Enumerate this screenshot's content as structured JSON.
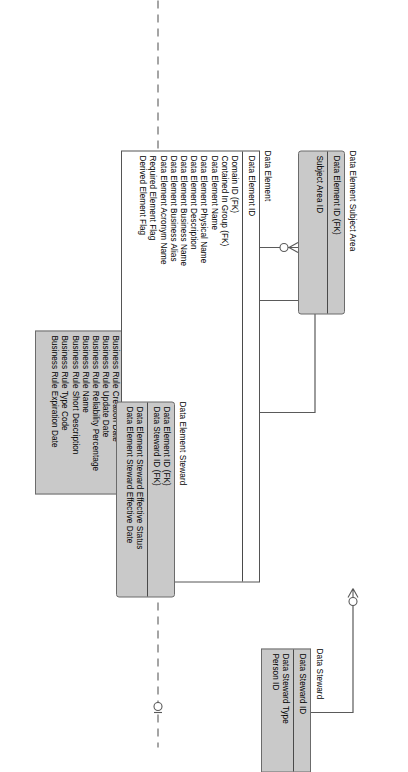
{
  "diagram": {
    "notation": "IDEF1X / crows-foot ER diagram",
    "orientation": "rotated-90-clockwise",
    "background_color": "#ffffff",
    "entity_fill": "#c9c9c9",
    "entity_fill_alt": "#ffffff",
    "line_color": "#5a5a5a"
  },
  "entities": [
    {
      "id": "data-steward",
      "name": "Data Steward",
      "fill": "#c9c9c9",
      "shape": "square",
      "keys": [
        "Data Steward ID"
      ],
      "attributes": [
        "Data Steward Type",
        "Person ID"
      ]
    },
    {
      "id": "business-rule",
      "name": "Business Rule",
      "fill": "#c9c9c9",
      "shape": "square",
      "keys": [
        "Business Rule ID"
      ],
      "attributes": [
        "Business Rule Status Code",
        "Business Rule Category",
        "Business Rule Effective Date",
        "Business Rule Creation Date",
        "Business Rule Update Date",
        "Business Rule Reliability Percentage",
        "Business Rule Name",
        "Business Rule Short Description",
        "Business Rule Type Code",
        "Business Rule Expiration Date"
      ]
    },
    {
      "id": "misc-business-rule",
      "name": "Misc Business Rule",
      "fill": "#c9c9c9",
      "shape": "rounded",
      "keys": [
        "Business Rule ID (FK)"
      ],
      "attributes": [
        "Data Element ID (FK)",
        "Business Rule Text"
      ]
    },
    {
      "id": "data-element-subject-area",
      "name": "Data Element Subject Area",
      "fill": "#c9c9c9",
      "shape": "rounded",
      "keys": [
        "Data Element ID (FK)"
      ],
      "attributes": [
        "Subject Area ID"
      ]
    },
    {
      "id": "data-element",
      "name": "Data Element",
      "fill": "#ffffff",
      "shape": "square",
      "keys": [
        "Data Element ID"
      ],
      "attributes": [
        "Domain ID (FK)",
        "Contained In Group (FK)",
        "Data Element Name",
        "Data Element Physical Name",
        "Data Element Description",
        "Data Element Business Name",
        "Data Element Business Alias",
        "Data Element Acronym Name",
        "Required Element Flag",
        "Derived Element Flag"
      ]
    },
    {
      "id": "data-element-steward",
      "name": "Data Element Steward",
      "fill": "#c9c9c9",
      "shape": "rounded",
      "keys": [
        "Data Element ID (FK)",
        "Data Steward ID (FK)"
      ],
      "attributes": [
        "Data Element Steward Effective Status",
        "Data Element Steward Effective Date"
      ]
    }
  ],
  "relationships": [
    {
      "id": "rel-business-rule-category",
      "from": "business-rule",
      "to": "misc-business-rule",
      "style": "solid",
      "symbol": "category-subtype-circle-x"
    },
    {
      "id": "rel-data-element-misc-business-rule",
      "from": "data-element",
      "to": "misc-business-rule",
      "style": "dashed",
      "symbol": "zero-or-one-crowsfoot"
    },
    {
      "id": "rel-data-element-subject-area",
      "from": "data-element",
      "to": "data-element-subject-area",
      "style": "solid",
      "symbol": "zero-or-more-crowsfoot"
    },
    {
      "id": "rel-data-element-steward",
      "from": "data-element",
      "to": "data-element-steward",
      "style": "solid",
      "symbol": "zero-or-more-crowsfoot"
    },
    {
      "id": "rel-data-steward-element-steward",
      "from": "data-steward",
      "to": "data-element-steward",
      "style": "solid",
      "symbol": "zero-or-more-crowsfoot"
    },
    {
      "id": "rel-data-element-external-top",
      "from": "data-element",
      "to": "offpage-top",
      "style": "dashed",
      "symbol": "zero-or-more-crowsfoot"
    },
    {
      "id": "rel-data-element-external-bottom",
      "from": "data-element",
      "to": "offpage-bottom",
      "style": "dashed",
      "symbol": "zero-or-one"
    }
  ]
}
